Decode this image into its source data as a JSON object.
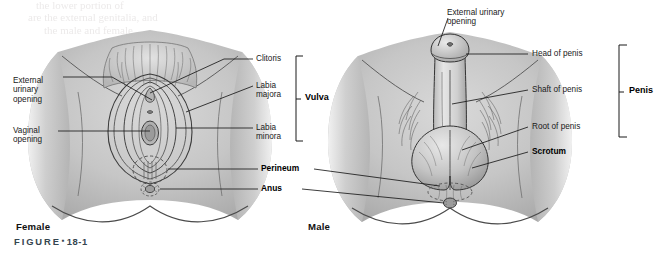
{
  "figure": {
    "caption_word": "FIGURE",
    "caption_marker": "▪",
    "caption_number": "18-1",
    "background_color": "#ffffff",
    "line_color": "#1a1a1a",
    "skin_light": "#e4e4e4",
    "skin_mid": "#c0c0c0",
    "skin_dark": "#8d8d8d",
    "ink": "#555555"
  },
  "panels": [
    {
      "id": "female",
      "title": "Female"
    },
    {
      "id": "male",
      "title": "Male"
    }
  ],
  "female_labels": {
    "external_urinary_opening": "External\nurinary\nopening",
    "vaginal_opening": "Vaginal\nopening",
    "clitoris": "Clitoris",
    "labia_majora": "Labia\nmajora",
    "labia_minora": "Labia\nminora",
    "bracket": "Vulva"
  },
  "male_labels": {
    "external_urinary_opening": "External urinary\nopening",
    "head_of_penis": "Head of penis",
    "shaft_of_penis": "Shaft of penis",
    "root_of_penis": "Root of penis",
    "scrotum": "Scrotum",
    "bracket": "Penis"
  },
  "shared_labels": {
    "perineum": "Perineum",
    "anus": "Anus"
  },
  "ghost_text": {
    "line1": "the lower portion of",
    "line2": "are the external genitalia, and",
    "line3": "the male and female"
  }
}
